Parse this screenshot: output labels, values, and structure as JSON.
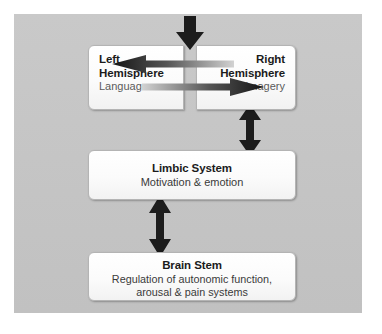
{
  "diagram": {
    "background_color": "#c6c6c6",
    "node_color": "#fcfcfc",
    "arrow_color": "#1c1c1c",
    "nodes": {
      "left_hemisphere": {
        "title": "Left\nHemisphere",
        "subtitle": "Language"
      },
      "right_hemisphere": {
        "title": "Right\nHemisphere",
        "subtitle": "Imagery"
      },
      "limbic_system": {
        "title": "Limbic System",
        "subtitle": "Motivation & emotion"
      },
      "brain_stem": {
        "title": "Brain Stem",
        "subtitle": "Regulation of autonomic function,\narousal & pain systems"
      }
    },
    "arrows": [
      {
        "name": "input-down-arrow",
        "direction": "down",
        "style": "solid",
        "from": "external input",
        "to": "hemispheres"
      },
      {
        "name": "right-to-left-hemisphere-arrow",
        "direction": "left",
        "style": "gradient",
        "from": "right_hemisphere",
        "to": "left_hemisphere"
      },
      {
        "name": "left-to-right-hemisphere-arrow",
        "direction": "right",
        "style": "gradient",
        "from": "left_hemisphere",
        "to": "right_hemisphere"
      },
      {
        "name": "right-hemisphere-limbic-arrow",
        "direction": "both",
        "style": "solid",
        "from": "right_hemisphere",
        "to": "limbic_system"
      },
      {
        "name": "limbic-brain-stem-arrow",
        "direction": "both",
        "style": "solid",
        "from": "limbic_system",
        "to": "brain_stem"
      }
    ]
  }
}
